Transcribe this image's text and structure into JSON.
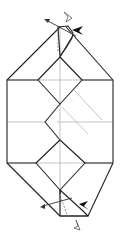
{
  "diagram": {
    "type": "origami-fold-step",
    "colors": {
      "edge": "#222222",
      "crease": "#b5b5b5",
      "arrow": "#111111",
      "background": "#ffffff"
    },
    "icons": [
      "push-arrow-icon",
      "fold-arrow-icon",
      "turn-arrow-icon"
    ],
    "annotations": {
      "top": {
        "push_arrow": "filled-black",
        "fold_arrow": "curved-hollow",
        "valley_line": "dashed"
      },
      "bottom": {
        "push_arrow": "filled-black",
        "fold_arrow": "curved-hollow",
        "valley_line": "dashed"
      }
    }
  }
}
